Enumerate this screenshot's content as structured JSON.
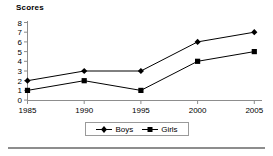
{
  "chart_data": {
    "type": "line",
    "title": "Scores",
    "xlabel": "",
    "ylabel": "",
    "categories": [
      "1985",
      "1990",
      "1995",
      "2000",
      "2005"
    ],
    "x": [
      1985,
      1990,
      1995,
      2000,
      2005
    ],
    "series": [
      {
        "name": "Boys",
        "marker": "diamond",
        "values": [
          2,
          3,
          3,
          6,
          7
        ]
      },
      {
        "name": "Girls",
        "marker": "square",
        "values": [
          1,
          2,
          1,
          4,
          5
        ]
      }
    ],
    "ylim": [
      0,
      8
    ],
    "yticks": [
      "0",
      "1",
      "2",
      "3",
      "4",
      "5",
      "6",
      "7",
      "8"
    ],
    "xticks": [
      "1985",
      "1990",
      "1995",
      "2000",
      "2005"
    ],
    "grid": false,
    "legend_position": "bottom-center",
    "colors": {
      "line": "#000000",
      "marker": "#000000",
      "axis": "#8d8d8d",
      "background": "#ffffff",
      "rule": "#8d8d8d"
    }
  },
  "legend": {
    "entries": [
      {
        "label": "Boys",
        "marker": "diamond-marker"
      },
      {
        "label": "Girls",
        "marker": "square-marker"
      }
    ]
  }
}
